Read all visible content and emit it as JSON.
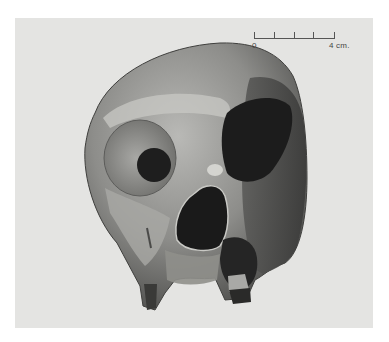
{
  "figure": {
    "background_color": "#e4e4e2",
    "page_color": "#ffffff"
  },
  "scale_bar": {
    "start_label": "0",
    "end_label": "4 cm.",
    "divisions": 4,
    "color": "#555555"
  }
}
